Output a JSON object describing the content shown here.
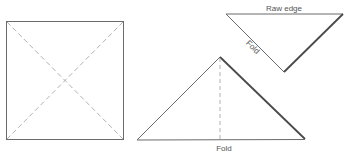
{
  "diagram": {
    "title": "",
    "colors": {
      "line": "#6b6b6b",
      "dash": "#a8a8a8",
      "text": "#555555",
      "heavy": "#4a4a4a"
    },
    "figures": [
      {
        "id": "square",
        "description": "Square with dashed diagonals (fold lines)"
      },
      {
        "id": "folded-triangle",
        "description": "Triangle folded in half with dashed center line"
      },
      {
        "id": "inverted-triangle",
        "description": "Inverted triangle showing raw edge and fold"
      }
    ],
    "labels": {
      "raw_edge": "Raw edge",
      "side_fold": "Fold",
      "bottom_fold": "Fold"
    }
  }
}
